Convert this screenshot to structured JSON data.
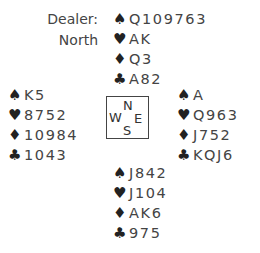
{
  "dealer": {
    "label": "Dealer:",
    "value": "North"
  },
  "suits": {
    "spades": "♠",
    "hearts": "♥",
    "diamonds": "♦",
    "clubs": "♣"
  },
  "compass": {
    "north": "N",
    "west": "W",
    "east": "E",
    "south": "S"
  },
  "hands": {
    "north": {
      "spades": "Q109763",
      "hearts": "AK",
      "diamonds": "Q3",
      "clubs": "A82"
    },
    "west": {
      "spades": "K5",
      "hearts": "8752",
      "diamonds": "10984",
      "clubs": "1043"
    },
    "east": {
      "spades": "A",
      "hearts": "Q963",
      "diamonds": "J752",
      "clubs": "KQJ6"
    },
    "south": {
      "spades": "J842",
      "hearts": "J104",
      "diamonds": "AK6",
      "clubs": "975"
    }
  }
}
